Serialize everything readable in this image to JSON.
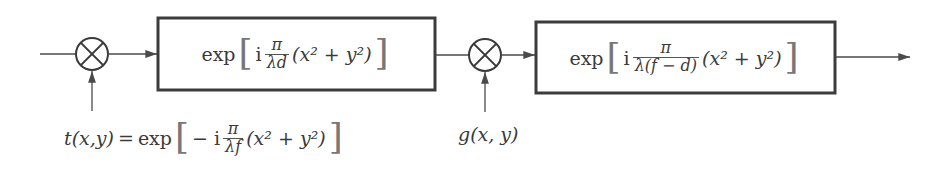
{
  "diagram": {
    "type": "block-diagram",
    "nodes": [
      {
        "id": "mult1",
        "kind": "multiplier",
        "symbol": "⊗"
      },
      {
        "id": "box1",
        "kind": "block",
        "func": "exp",
        "coef_prefix": "i",
        "num": "π",
        "den": "λd",
        "arg": "(x² + y²)"
      },
      {
        "id": "mult2",
        "kind": "multiplier",
        "symbol": "⊗"
      },
      {
        "id": "box2",
        "kind": "block",
        "func": "exp",
        "coef_prefix": "i",
        "num": "π",
        "den": "λ(f − d)",
        "arg": "(x² + y²)"
      }
    ],
    "inputs": {
      "t": {
        "lhs": "t(x,y)",
        "eq": "=",
        "func": "exp",
        "coef_prefix": "− i",
        "num": "π",
        "den": "λf",
        "arg": "(x² + y²)"
      },
      "g": {
        "label": "g(x, y)"
      }
    },
    "edges": [
      [
        "input",
        "mult1"
      ],
      [
        "t",
        "mult1"
      ],
      [
        "mult1",
        "box1"
      ],
      [
        "box1",
        "mult2"
      ],
      [
        "g",
        "mult2"
      ],
      [
        "mult2",
        "box2"
      ],
      [
        "box2",
        "output"
      ]
    ]
  },
  "colors": {
    "line": "#4a4a4a",
    "box_border": "#3c3c3c",
    "text": "#3a3a3a",
    "background": "#ffffff"
  }
}
